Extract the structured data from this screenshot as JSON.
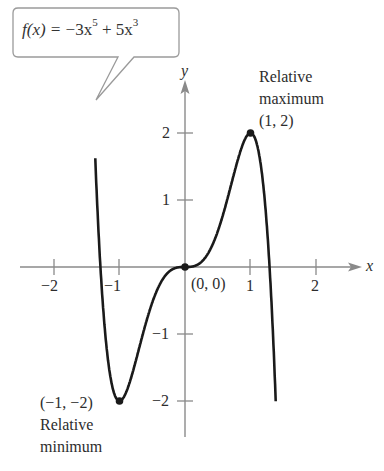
{
  "callout": {
    "func_name": "f(x) = ",
    "term1_sign": "−3x",
    "term1_exp": "5",
    "term2": " + 5x",
    "term2_exp": "3",
    "full_text": "f(x) = −3x^5 + 5x^3"
  },
  "axes": {
    "x_label": "x",
    "y_label": "y",
    "x_ticks": [
      "−2",
      "−1",
      "1",
      "2"
    ],
    "y_ticks": [
      "2",
      "1",
      "−1",
      "−2"
    ]
  },
  "annotations": {
    "max_label_line1": "Relative",
    "max_label_line2": "maximum",
    "max_point": "(1, 2)",
    "origin_point": "(0, 0)",
    "min_point": "(−1, −2)",
    "min_label_line1": "Relative",
    "min_label_line2": "minimum"
  },
  "colors": {
    "curve": "#1a1a1a",
    "axis": "#8a8a8a",
    "callout_border": "#9a9a9a",
    "text": "#2d2d2d"
  },
  "chart_data": {
    "type": "line",
    "xlabel": "x",
    "ylabel": "y",
    "xlim": [
      -2.5,
      3
    ],
    "ylim": [
      -2.5,
      3
    ],
    "grid": false,
    "function": "-3x^5 + 5x^3",
    "x_ticks": [
      -2,
      -1,
      1,
      2
    ],
    "y_ticks": [
      -2,
      -1,
      1,
      2
    ],
    "series": [
      {
        "name": "f(x) = -3x^5 + 5x^3",
        "x": [
          -1.37,
          -1.3,
          -1.2,
          -1.1,
          -1.0,
          -0.8,
          -0.6,
          -0.4,
          -0.2,
          0,
          0.2,
          0.4,
          0.6,
          0.8,
          1.0,
          1.1,
          1.2,
          1.3,
          1.38
        ],
        "values": [
          2.5,
          0.15,
          -1.19,
          -1.7,
          -2.0,
          -1.58,
          -0.85,
          -0.29,
          -0.04,
          0,
          0.04,
          0.29,
          0.85,
          1.58,
          2.0,
          1.7,
          1.19,
          -0.15,
          -2.5
        ]
      }
    ],
    "points": [
      {
        "label": "Relative maximum (1, 2)",
        "x": 1,
        "y": 2
      },
      {
        "label": "(0, 0)",
        "x": 0,
        "y": 0
      },
      {
        "label": "Relative minimum (-1, -2)",
        "x": -1,
        "y": -2
      }
    ]
  }
}
